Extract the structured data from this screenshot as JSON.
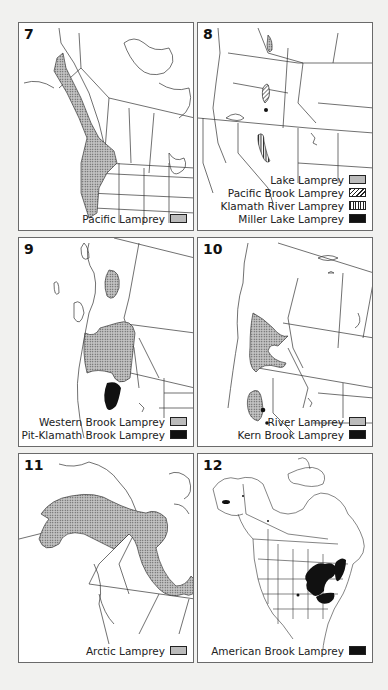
{
  "figure": {
    "panels": [
      {
        "number": "7",
        "legend": [
          {
            "label": "Pacific Lamprey",
            "pattern": "stipple"
          }
        ]
      },
      {
        "number": "8",
        "legend": [
          {
            "label": "Lake Lamprey",
            "pattern": "stipple"
          },
          {
            "label": "Pacific Brook Lamprey",
            "pattern": "hatch"
          },
          {
            "label": "Klamath River Lamprey",
            "pattern": "vert"
          },
          {
            "label": "Miller Lake Lamprey",
            "pattern": "solid"
          }
        ]
      },
      {
        "number": "9",
        "legend": [
          {
            "label": "Western Brook Lamprey",
            "pattern": "stipple"
          },
          {
            "label": "Pit-Klamath Brook Lamprey",
            "pattern": "solid"
          }
        ]
      },
      {
        "number": "10",
        "legend": [
          {
            "label": "River Lamprey",
            "pattern": "stipple"
          },
          {
            "label": "Kern Brook Lamprey",
            "pattern": "solid"
          }
        ]
      },
      {
        "number": "11",
        "legend": [
          {
            "label": "Arctic Lamprey",
            "pattern": "stipple"
          }
        ]
      },
      {
        "number": "12",
        "legend": [
          {
            "label": "American Brook Lamprey",
            "pattern": "solid"
          }
        ]
      }
    ]
  },
  "colors": {
    "background": "#f1f1ef",
    "panel": "#ffffff",
    "border": "#6a6a6a",
    "ink": "#111111"
  }
}
